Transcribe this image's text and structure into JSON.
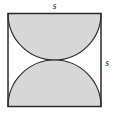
{
  "figure": {
    "name": "square-with-semicircle-and-curved-triangle",
    "background_color": "#ffffff",
    "square": {
      "name": "outer-square",
      "side_label": "s",
      "stroke_color": "#2b2b2b",
      "fill_color": "#ffffff",
      "x": 8,
      "y": 13.5,
      "side": 93
    },
    "labels": {
      "top": {
        "text": "s",
        "x": 54.5,
        "y": 9
      },
      "right": {
        "text": "s",
        "x": 107,
        "y": 66
      }
    },
    "shaded_regions": [
      {
        "name": "top-semicircle",
        "shape": "semicircle",
        "fill_color": "#d7d7d7",
        "stroke_color": "#2b2b2b",
        "center_x": 54.5,
        "center_y": 13.5,
        "radius": 46.5,
        "note": "Diameter lies along the top side of the square; bulges downward to the square's center."
      },
      {
        "name": "bottom-curved-triangle",
        "shape": "curvilinear-triangle",
        "fill_color": "#d7d7d7",
        "stroke_color": "#2b2b2b",
        "note": "Bounded below by the bottom side of the square and above by two quarter-circle arcs of radius s/2 centered at the bottom-left and bottom-right corners, meeting at the square's center."
      }
    ]
  }
}
